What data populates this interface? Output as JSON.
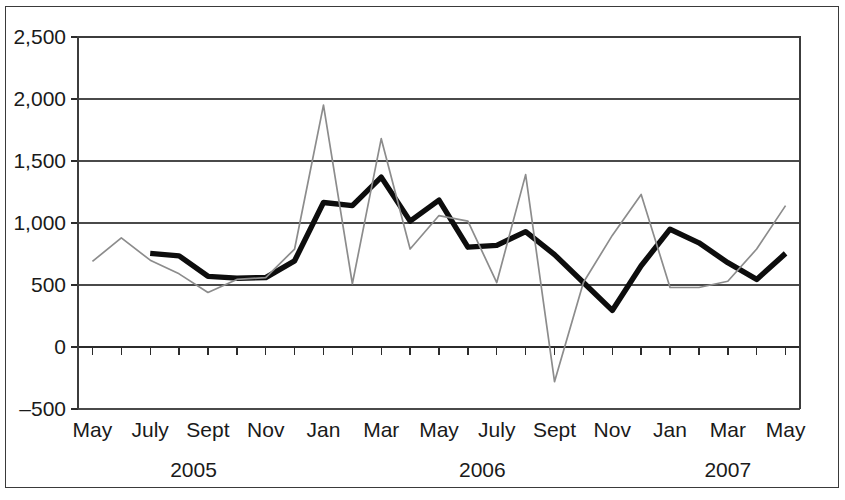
{
  "figure": {
    "background_color": "#ffffff",
    "frame_color": "#3a3a3a"
  },
  "chart_data": {
    "type": "line",
    "title": "",
    "subtitle": "",
    "xlabel": "",
    "ylabel": "",
    "ylim": [
      -500,
      2500
    ],
    "ytick_values": [
      2500,
      2000,
      1500,
      1000,
      500,
      0,
      -500
    ],
    "ytick_labels": [
      "2,500",
      "2,000",
      "1,500",
      "1,000",
      "500",
      "0",
      "–500"
    ],
    "grid": true,
    "grid_axis": "y",
    "legend": "none",
    "x_label_interval": 2,
    "x": [
      "May 2005",
      "June 2005",
      "July 2005",
      "Aug 2005",
      "Sept 2005",
      "Oct 2005",
      "Nov 2005",
      "Dec 2005",
      "Jan 2006",
      "Feb 2006",
      "Mar 2006",
      "Apr 2006",
      "May 2006",
      "June 2006",
      "July 2006",
      "Aug 2006",
      "Sept 2006",
      "Oct 2006",
      "Nov 2006",
      "Dec 2006",
      "Jan 2007",
      "Feb 2007",
      "Mar 2007",
      "Apr 2007",
      "May 2007"
    ],
    "xtick_labels": [
      "May",
      "",
      "July",
      "",
      "Sept",
      "",
      "Nov",
      "",
      "Jan",
      "",
      "Mar",
      "",
      "May",
      "",
      "July",
      "",
      "Sept",
      "",
      "Nov",
      "",
      "Jan",
      "",
      "Mar",
      "",
      "May"
    ],
    "year_groups": [
      {
        "label": "2005",
        "start_index": 0,
        "end_index": 7
      },
      {
        "label": "2006",
        "start_index": 8,
        "end_index": 19
      },
      {
        "label": "2007",
        "start_index": 20,
        "end_index": 24
      }
    ],
    "series": [
      {
        "name": "primary",
        "style": "thick black line",
        "color": "#0d0d0d",
        "line_width": 5.4,
        "start_index": 2,
        "values": [
          null,
          null,
          755,
          735,
          570,
          555,
          560,
          695,
          1165,
          1140,
          1370,
          1015,
          1185,
          805,
          820,
          930,
          745,
          520,
          295,
          655,
          950,
          840,
          680,
          545,
          755
        ]
      },
      {
        "name": "secondary",
        "style": "thin gray line",
        "color": "#8c8c8c",
        "line_width": 1.7,
        "start_index": 0,
        "values": [
          690,
          880,
          700,
          590,
          440,
          545,
          560,
          790,
          1950,
          510,
          1680,
          790,
          1060,
          1015,
          520,
          1390,
          -280,
          520,
          900,
          1230,
          480,
          480,
          530,
          790,
          1140
        ]
      }
    ]
  }
}
